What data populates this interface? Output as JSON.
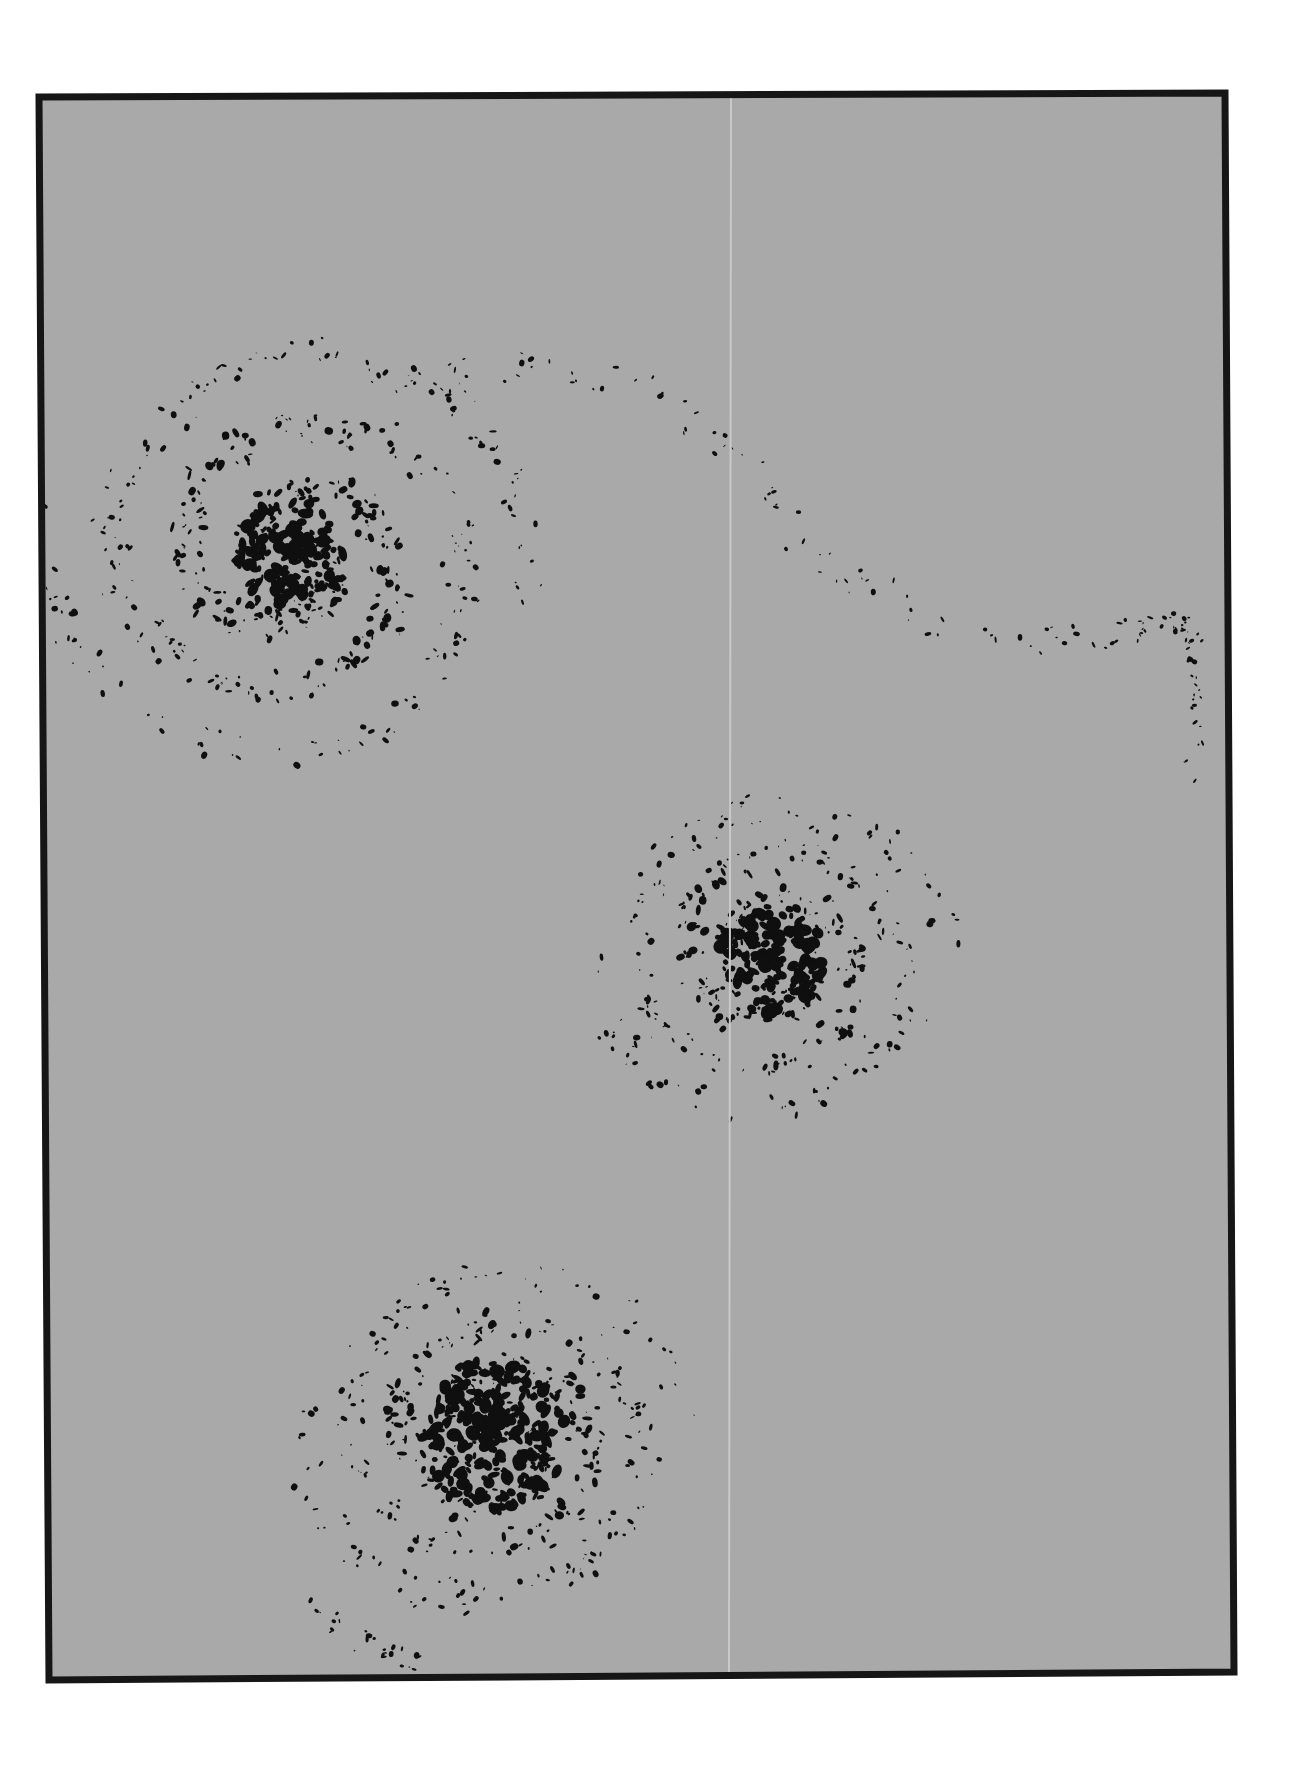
{
  "artwork": {
    "description": "Abstract monochrome print: gray panel in a thick black frame with three dark ink-blot spiral clusters and a faint vertical seam",
    "colors": {
      "page_background": "#ffffff",
      "panel_fill": "#a9a9a9",
      "frame": "#161616",
      "ink": "#0f0f0f",
      "seam": "#c9c9c9"
    },
    "frame": {
      "corners": {
        "top_left": [
          39,
          97
        ],
        "top_right": [
          1225,
          93
        ],
        "bottom_right": [
          1234,
          1672
        ],
        "bottom_left": [
          49,
          1680
        ]
      },
      "thickness": 7
    },
    "seam": {
      "top": [
        731,
        98
      ],
      "bottom": [
        729,
        1676
      ],
      "width": 2
    },
    "clusters": [
      {
        "name": "upper-left-spiral",
        "center": [
          290,
          555
        ],
        "core_radius": 55,
        "halo_radius": 210,
        "density": 520,
        "core_density": 140,
        "seed": 11
      },
      {
        "name": "middle-right-cluster",
        "center": [
          770,
          960
        ],
        "core_radius": 55,
        "halo_radius": 150,
        "density": 380,
        "core_density": 170,
        "seed": 23
      },
      {
        "name": "lower-center-cluster",
        "center": [
          495,
          1435
        ],
        "core_radius": 75,
        "halo_radius": 150,
        "density": 420,
        "core_density": 260,
        "seed": 37
      }
    ],
    "trails": [
      {
        "name": "upper-swirl-trail",
        "points": [
          [
            380,
            390
          ],
          [
            520,
            365
          ],
          [
            640,
            380
          ],
          [
            740,
            460
          ],
          [
            820,
            560
          ],
          [
            960,
            640
          ],
          [
            1100,
            640
          ],
          [
            1190,
            620
          ]
        ],
        "count": 90,
        "spread": 30,
        "seed": 51
      },
      {
        "name": "right-edge-scatter",
        "points": [
          [
            1120,
            630
          ],
          [
            1190,
            625
          ],
          [
            1200,
            690
          ],
          [
            1190,
            780
          ]
        ],
        "count": 40,
        "spread": 18,
        "seed": 63
      },
      {
        "name": "bottom-left-scatter",
        "points": [
          [
            300,
            1600
          ],
          [
            360,
            1640
          ],
          [
            420,
            1665
          ]
        ],
        "count": 25,
        "spread": 20,
        "seed": 77
      }
    ]
  }
}
